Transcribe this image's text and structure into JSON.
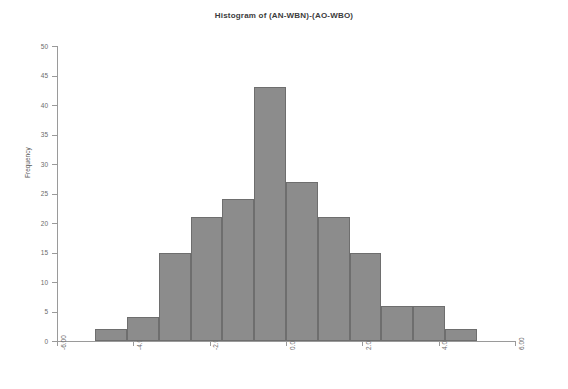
{
  "chart_data": {
    "type": "bar",
    "title": "Histogram of (AN-WBN)-(AO-WBO)",
    "xlabel": "",
    "ylabel": "Frequency",
    "xlim": [
      -6.0,
      6.0
    ],
    "ylim": [
      0,
      50
    ],
    "grid": false,
    "legend": null,
    "bin_width": 0.8333,
    "bin_edges": [
      -5.0,
      -4.1667,
      -3.3333,
      -2.5,
      -1.6667,
      -0.8333,
      0.0,
      0.8333,
      1.6667,
      2.5,
      3.3333,
      4.1667,
      5.0
    ],
    "bin_centers": [
      -4.5833,
      -3.75,
      -2.9167,
      -2.0833,
      -1.25,
      -0.4167,
      0.4167,
      1.25,
      2.0833,
      2.9167,
      3.75,
      4.5833
    ],
    "categories": [
      "-4.58",
      "-3.75",
      "-2.92",
      "-2.08",
      "-1.25",
      "-0.42",
      "0.42",
      "1.25",
      "2.08",
      "2.92",
      "3.75",
      "4.58"
    ],
    "values": [
      2,
      4,
      15,
      21,
      24,
      43,
      27,
      21,
      15,
      6,
      6,
      2
    ],
    "bar_color": "#8c8c8c",
    "bar_edge_color": "#6e6e6e",
    "axis_color": "#9a9a9a",
    "x_ticks": [
      {
        "value": -6.0,
        "label": "-6.00"
      },
      {
        "value": -4.0,
        "label": "-4.00"
      },
      {
        "value": -2.0,
        "label": "-2.00"
      },
      {
        "value": 0.0,
        "label": "0.00"
      },
      {
        "value": 2.0,
        "label": "2.00"
      },
      {
        "value": 4.0,
        "label": "4.00"
      },
      {
        "value": 6.0,
        "label": "6.00"
      }
    ],
    "y_ticks": [
      {
        "value": 0,
        "label": "0"
      },
      {
        "value": 5,
        "label": "5"
      },
      {
        "value": 10,
        "label": "10"
      },
      {
        "value": 15,
        "label": "15"
      },
      {
        "value": 20,
        "label": "20"
      },
      {
        "value": 25,
        "label": "25"
      },
      {
        "value": 30,
        "label": "30"
      },
      {
        "value": 35,
        "label": "35"
      },
      {
        "value": 40,
        "label": "40"
      },
      {
        "value": 45,
        "label": "45"
      },
      {
        "value": 50,
        "label": "50"
      }
    ]
  }
}
